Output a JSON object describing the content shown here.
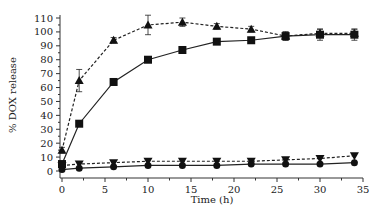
{
  "chart_data": {
    "type": "line",
    "title": "",
    "xlabel": "Time (h)",
    "ylabel": "% DOX release",
    "xlim": [
      0,
      35
    ],
    "ylim": [
      0,
      110
    ],
    "xticks": [
      0,
      5,
      10,
      15,
      20,
      25,
      30,
      35
    ],
    "yticks": [
      0,
      10,
      20,
      30,
      40,
      50,
      60,
      70,
      80,
      90,
      100,
      110
    ],
    "grid": false,
    "legend": null,
    "x": [
      0,
      2,
      6,
      10,
      14,
      18,
      22,
      26,
      30,
      34
    ],
    "series": [
      {
        "name": "triangle-up",
        "marker": "triangle-up",
        "linestyle": "dashed",
        "x": [
          0,
          2,
          6,
          10,
          14,
          18,
          22,
          26,
          30,
          34
        ],
        "values": [
          15,
          65,
          94,
          105,
          107,
          104,
          102,
          97,
          99,
          99
        ],
        "errors": [
          2,
          8,
          2,
          7,
          3,
          2,
          2,
          3,
          3,
          3
        ]
      },
      {
        "name": "square",
        "marker": "square",
        "linestyle": "solid",
        "x": [
          0,
          2,
          6,
          10,
          14,
          18,
          22,
          26,
          30,
          34
        ],
        "values": [
          5,
          34,
          64,
          80,
          87,
          93,
          94,
          97,
          98,
          98
        ],
        "errors": [
          1,
          1,
          1,
          1,
          1,
          1,
          1,
          3,
          4,
          4
        ]
      },
      {
        "name": "triangle-down",
        "marker": "triangle-down",
        "linestyle": "dashed",
        "x": [
          0,
          2,
          6,
          10,
          14,
          18,
          22,
          26,
          30,
          34
        ],
        "values": [
          4,
          5,
          6,
          7,
          7,
          7,
          7,
          8,
          9,
          11
        ],
        "errors": [
          1,
          1,
          1,
          1,
          1,
          1,
          1,
          1,
          1,
          1
        ]
      },
      {
        "name": "circle",
        "marker": "circle",
        "linestyle": "solid",
        "x": [
          0,
          2,
          6,
          10,
          14,
          18,
          22,
          26,
          30,
          34
        ],
        "values": [
          1,
          2,
          3,
          4,
          4,
          4,
          5,
          5,
          5,
          6
        ],
        "errors": [
          0.5,
          0.5,
          0.5,
          0.5,
          0.5,
          0.5,
          0.5,
          0.5,
          0.5,
          0.5
        ]
      }
    ]
  }
}
